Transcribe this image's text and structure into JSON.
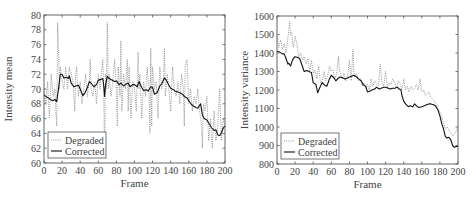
{
  "chart_data": [
    {
      "type": "line",
      "title": "",
      "xlabel": "Frame",
      "ylabel": "Intensity mean",
      "xlim": [
        0,
        200
      ],
      "ylim": [
        60,
        80
      ],
      "xticks": [
        0,
        20,
        40,
        60,
        80,
        100,
        120,
        140,
        160,
        180,
        200
      ],
      "yticks": [
        60,
        62,
        64,
        66,
        68,
        70,
        72,
        74,
        76,
        78,
        80
      ],
      "grid": false,
      "legend_position": "lower left",
      "legend": [
        "Degraded",
        "Corrected"
      ],
      "series": [
        {
          "name": "Degraded",
          "style": "dotted",
          "color": "#8a8a8a",
          "x": [
            0,
            2,
            4,
            6,
            8,
            10,
            12,
            13,
            14,
            15,
            16,
            17,
            18,
            20,
            22,
            24,
            26,
            28,
            30,
            32,
            34,
            35,
            36,
            38,
            40,
            42,
            44,
            46,
            48,
            50,
            51,
            52,
            54,
            56,
            58,
            60,
            62,
            64,
            65,
            66,
            67,
            68,
            69,
            70,
            71,
            72,
            74,
            76,
            78,
            80,
            81,
            82,
            84,
            85,
            86,
            88,
            90,
            92,
            93,
            94,
            96,
            98,
            100,
            102,
            104,
            105,
            106,
            108,
            110,
            112,
            114,
            116,
            117,
            118,
            119,
            120,
            122,
            124,
            126,
            128,
            130,
            132,
            133,
            134,
            136,
            138,
            140,
            142,
            144,
            146,
            148,
            150,
            152,
            154,
            155,
            156,
            158,
            160,
            162,
            164,
            166,
            168,
            170,
            172,
            174,
            175,
            176,
            178,
            180,
            182,
            184,
            185,
            186,
            188,
            190,
            192,
            194,
            196,
            198,
            200
          ],
          "y": [
            70,
            68,
            71,
            66,
            72,
            69,
            70,
            67,
            65,
            79,
            76,
            70,
            73,
            71,
            70,
            73,
            70,
            73,
            72,
            71,
            67,
            72,
            73,
            69,
            71,
            68,
            70,
            72,
            69,
            71,
            74,
            70,
            69,
            71,
            68,
            72,
            70,
            73,
            74,
            70,
            61,
            72,
            70,
            79,
            70,
            72,
            69,
            71,
            74,
            70,
            65,
            73,
            69,
            76.5,
            67,
            72,
            70,
            74,
            67,
            73,
            66,
            71,
            70,
            67,
            75,
            70,
            72,
            66,
            71,
            69,
            73,
            70,
            64,
            75.5,
            65,
            73,
            70,
            71,
            66,
            73,
            70,
            71,
            75.5,
            69,
            72,
            70,
            67,
            73,
            70,
            69,
            71,
            68,
            72,
            70,
            65,
            73,
            74,
            68,
            70,
            67,
            69,
            68,
            70,
            67,
            65,
            62,
            68,
            67,
            69,
            63,
            66,
            64,
            62,
            67,
            63,
            65,
            70,
            63,
            66,
            65
          ]
        },
        {
          "name": "Corrected",
          "style": "solid",
          "color": "#111111",
          "x": [
            0,
            3,
            5,
            8,
            10,
            12,
            14,
            16,
            18,
            20,
            22,
            25,
            27,
            28,
            30,
            33,
            35,
            38,
            40,
            43,
            45,
            48,
            50,
            52,
            55,
            58,
            60,
            63,
            65,
            66,
            67,
            68,
            70,
            72,
            75,
            78,
            80,
            83,
            85,
            88,
            90,
            93,
            95,
            98,
            100,
            103,
            105,
            108,
            110,
            113,
            115,
            118,
            120,
            122,
            125,
            128,
            130,
            133,
            135,
            138,
            140,
            143,
            145,
            148,
            150,
            153,
            155,
            158,
            160,
            163,
            165,
            168,
            170,
            173,
            175,
            177,
            180,
            182,
            185,
            188,
            190,
            192,
            194,
            196,
            198,
            200
          ],
          "y": [
            69.2,
            68.9,
            68.8,
            68.5,
            68.4,
            68.6,
            68.3,
            70,
            72,
            72,
            71.5,
            71.6,
            71.4,
            71.8,
            70.8,
            70.3,
            70.4,
            70.5,
            70,
            69.1,
            69.4,
            70.2,
            71,
            70.8,
            70.3,
            70.6,
            71.2,
            71.3,
            71.4,
            70.5,
            69,
            70.5,
            71.7,
            71.4,
            71.2,
            71,
            71.1,
            70.6,
            70.8,
            70.4,
            70.6,
            70.8,
            70.3,
            70.6,
            70.6,
            70.3,
            71,
            70.2,
            69.8,
            69.9,
            69.7,
            70.3,
            70.2,
            69.3,
            69.5,
            70.4,
            70.7,
            71.5,
            71.2,
            70.5,
            70.1,
            69.9,
            69.7,
            69.6,
            69.5,
            69.3,
            69,
            68.8,
            68.4,
            67.9,
            67.7,
            67.5,
            67.4,
            68,
            66.5,
            66,
            65.8,
            65.4,
            64.8,
            64.4,
            64.5,
            63.8,
            63.7,
            64.1,
            64.7,
            65
          ]
        }
      ]
    },
    {
      "type": "line",
      "title": "",
      "xlabel": "Frame",
      "ylabel": "Intensity variance",
      "xlim": [
        0,
        200
      ],
      "ylim": [
        800,
        1600
      ],
      "xticks": [
        0,
        20,
        40,
        60,
        80,
        100,
        120,
        140,
        160,
        180,
        200
      ],
      "yticks": [
        800,
        900,
        1000,
        1100,
        1200,
        1300,
        1400,
        1500,
        1600
      ],
      "grid": false,
      "legend_position": "lower left",
      "legend": [
        "Degraded",
        "Corrected"
      ],
      "series": [
        {
          "name": "Degraded",
          "style": "dotted",
          "color": "#8a8a8a",
          "x": [
            0,
            2,
            4,
            6,
            8,
            10,
            12,
            14,
            15,
            16,
            18,
            20,
            22,
            24,
            26,
            28,
            30,
            32,
            34,
            36,
            38,
            40,
            42,
            44,
            46,
            48,
            50,
            52,
            54,
            56,
            58,
            60,
            62,
            64,
            66,
            68,
            69,
            70,
            72,
            74,
            76,
            78,
            80,
            82,
            84,
            85,
            86,
            88,
            90,
            92,
            94,
            96,
            98,
            100,
            102,
            104,
            106,
            108,
            110,
            112,
            114,
            116,
            118,
            120,
            122,
            124,
            126,
            128,
            130,
            132,
            134,
            136,
            138,
            140,
            142,
            144,
            146,
            148,
            150,
            152,
            154,
            156,
            158,
            160,
            162,
            164,
            166,
            168,
            170,
            172,
            174,
            176,
            178,
            180,
            182,
            184,
            186,
            188,
            190,
            192,
            194,
            196,
            198,
            200
          ],
          "y": [
            1490,
            1430,
            1470,
            1420,
            1450,
            1400,
            1480,
            1570,
            1500,
            1510,
            1430,
            1490,
            1450,
            1380,
            1400,
            1360,
            1380,
            1340,
            1370,
            1300,
            1360,
            1290,
            1310,
            1260,
            1330,
            1240,
            1250,
            1300,
            1250,
            1280,
            1330,
            1300,
            1310,
            1260,
            1290,
            1380,
            1300,
            1290,
            1260,
            1290,
            1250,
            1280,
            1360,
            1250,
            1420,
            1300,
            1270,
            1290,
            1250,
            1260,
            1220,
            1240,
            1210,
            1230,
            1200,
            1260,
            1220,
            1250,
            1230,
            1220,
            1340,
            1240,
            1220,
            1300,
            1210,
            1240,
            1230,
            1260,
            1240,
            1210,
            1250,
            1230,
            1200,
            1260,
            1200,
            1220,
            1190,
            1220,
            1200,
            1210,
            1230,
            1200,
            1260,
            1190,
            1200,
            1170,
            1180,
            1190,
            1160,
            1150,
            1140,
            1120,
            1100,
            1080,
            1060,
            1020,
            990,
            1000,
            980,
            970,
            950,
            960,
            980,
            1000
          ]
        },
        {
          "name": "Corrected",
          "style": "solid",
          "color": "#111111",
          "x": [
            0,
            3,
            6,
            8,
            10,
            12,
            13,
            15,
            17,
            18,
            20,
            23,
            25,
            28,
            30,
            33,
            35,
            38,
            40,
            43,
            45,
            47,
            50,
            53,
            55,
            58,
            60,
            63,
            65,
            68,
            70,
            73,
            75,
            78,
            80,
            83,
            85,
            88,
            90,
            93,
            95,
            98,
            100,
            103,
            105,
            108,
            110,
            113,
            115,
            118,
            120,
            123,
            125,
            128,
            130,
            133,
            135,
            137,
            138,
            140,
            142,
            145,
            147,
            150,
            152,
            155,
            157,
            160,
            163,
            165,
            168,
            170,
            173,
            175,
            178,
            180,
            182,
            184,
            186,
            188,
            190,
            192,
            194,
            196,
            198,
            200
          ],
          "y": [
            1410,
            1405,
            1395,
            1395,
            1370,
            1340,
            1345,
            1330,
            1360,
            1370,
            1380,
            1375,
            1370,
            1330,
            1300,
            1305,
            1300,
            1295,
            1240,
            1230,
            1185,
            1210,
            1240,
            1225,
            1220,
            1260,
            1280,
            1265,
            1250,
            1265,
            1270,
            1265,
            1260,
            1265,
            1270,
            1275,
            1280,
            1270,
            1260,
            1250,
            1230,
            1220,
            1190,
            1195,
            1200,
            1205,
            1215,
            1205,
            1210,
            1215,
            1215,
            1210,
            1205,
            1210,
            1210,
            1215,
            1205,
            1200,
            1170,
            1140,
            1125,
            1110,
            1115,
            1110,
            1125,
            1110,
            1105,
            1110,
            1115,
            1120,
            1125,
            1125,
            1120,
            1115,
            1090,
            1060,
            1020,
            990,
            950,
            940,
            945,
            930,
            900,
            890,
            895,
            895
          ]
        }
      ]
    }
  ],
  "charts": {
    "left": {
      "ylabel": "Intensity mean",
      "xlabel": "Frame",
      "legend": {
        "degraded": "Degraded",
        "corrected": "Corrected"
      }
    },
    "right": {
      "ylabel": "Intensity variance",
      "xlabel": "Frame",
      "legend": {
        "degraded": "Degraded",
        "corrected": "Corrected"
      }
    }
  }
}
